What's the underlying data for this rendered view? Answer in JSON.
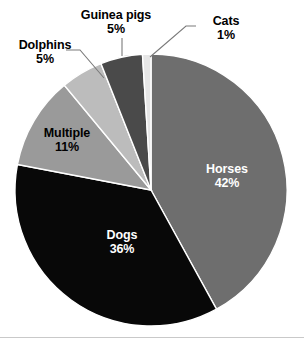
{
  "chart_data": {
    "type": "pie",
    "title": "",
    "subtitle": "",
    "xlabel": "",
    "ylabel": "",
    "legend_position": "none",
    "grid": false,
    "units": "percent",
    "start_angle_deg": 0,
    "direction": "clockwise",
    "categories": [
      "Horses",
      "Dogs",
      "Multiple",
      "Dolphins",
      "Guinea pigs",
      "Cats"
    ],
    "values": [
      42,
      36,
      11,
      5,
      5,
      1
    ],
    "slices": [
      {
        "label": "Horses",
        "value": 42,
        "value_text": "42%",
        "color": "#6e6e6e",
        "text_color": "#ffffff",
        "label_placement": "inside",
        "start_deg": 0,
        "end_deg": 151.2
      },
      {
        "label": "Dogs",
        "value": 36,
        "value_text": "36%",
        "color": "#080808",
        "text_color": "#ffffff",
        "label_placement": "inside",
        "start_deg": 151.2,
        "end_deg": 280.8
      },
      {
        "label": "Multiple",
        "value": 11,
        "value_text": "11%",
        "color": "#9a9a9a",
        "text_color": "#000000",
        "label_placement": "inside",
        "start_deg": 280.8,
        "end_deg": 320.4
      },
      {
        "label": "Dolphins",
        "value": 5,
        "value_text": "5%",
        "color": "#bcbcbc",
        "text_color": "#000000",
        "label_placement": "outside",
        "start_deg": 320.4,
        "end_deg": 338.4
      },
      {
        "label": "Guinea pigs",
        "value": 5,
        "value_text": "5%",
        "color": "#4a4a4a",
        "text_color": "#000000",
        "label_placement": "outside",
        "start_deg": 338.4,
        "end_deg": 356.4
      },
      {
        "label": "Cats",
        "value": 1,
        "value_text": "1%",
        "color": "#e6e6e6",
        "text_color": "#000000",
        "label_placement": "outside",
        "start_deg": 356.4,
        "end_deg": 360
      }
    ]
  },
  "labels": {
    "horses": {
      "name": "Horses",
      "percent": "42%"
    },
    "dogs": {
      "name": "Dogs",
      "percent": "36%"
    },
    "multiple": {
      "name": "Multiple",
      "percent": "11%"
    },
    "dolphins": {
      "name": "Dolphins",
      "percent": "5%"
    },
    "guinea_pigs": {
      "name": "Guinea pigs",
      "percent": "5%"
    },
    "cats": {
      "name": "Cats",
      "percent": "1%"
    }
  },
  "style": {
    "background": "#ffffff",
    "slice_separator": "#ffffff",
    "rule_color": "#c9c9c9"
  }
}
